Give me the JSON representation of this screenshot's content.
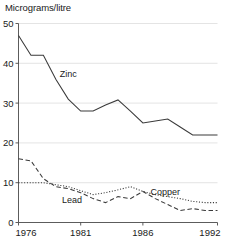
{
  "chart_data": {
    "type": "line",
    "title": "Micrograms/litre",
    "xlabel": "",
    "ylabel": "",
    "ylim": [
      0,
      50
    ],
    "xlim": [
      1976,
      1992
    ],
    "grid": true,
    "legend_position": "inline-annotations",
    "y_ticks": [
      0,
      10,
      20,
      30,
      40,
      50
    ],
    "y_tick_labels": [
      "0",
      "10",
      "20",
      "30",
      "40",
      "50"
    ],
    "x_ticks": [
      1976,
      1981,
      1986,
      1992
    ],
    "x_tick_labels": [
      "1976",
      "1981",
      "1986",
      "1992"
    ],
    "x": [
      1976,
      1977,
      1978,
      1979,
      1980,
      1981,
      1982,
      1983,
      1984,
      1985,
      1986,
      1987,
      1988,
      1989,
      1990,
      1991,
      1992
    ],
    "series": [
      {
        "name": "Zinc",
        "style": "solid",
        "label_x": 1980.0,
        "label_y": 36.5,
        "values": [
          47,
          42,
          42,
          36,
          31,
          28,
          28,
          29.5,
          30.8,
          28,
          25,
          25.5,
          26,
          24,
          22,
          22,
          22
        ]
      },
      {
        "name": "Lead",
        "style": "dashed",
        "label_x": 1980.3,
        "label_y": 5.0,
        "values": [
          16,
          15.5,
          11,
          9,
          8.5,
          7.5,
          6,
          5,
          6.5,
          6,
          7.8,
          6,
          4.5,
          3,
          3.5,
          3,
          3
        ]
      },
      {
        "name": "Copper",
        "style": "dotted",
        "label_x": 1987.8,
        "label_y": 7.0,
        "values": [
          10,
          10,
          10,
          9.5,
          9,
          8,
          7,
          7.5,
          8.2,
          9,
          7.8,
          7,
          6.5,
          6,
          5.3,
          5,
          5
        ]
      }
    ]
  },
  "axes": {
    "y_axis_name": "value-axis",
    "x_axis_name": "year-axis"
  }
}
